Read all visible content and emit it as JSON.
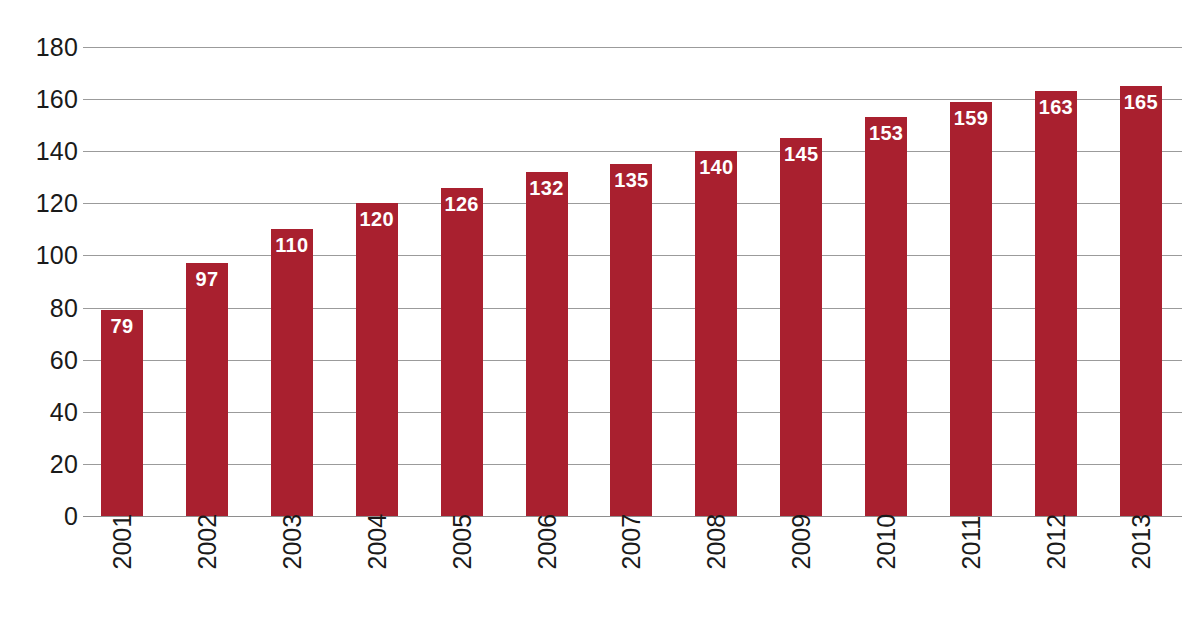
{
  "chart_data": {
    "type": "bar",
    "title": "",
    "subtitle": "",
    "xlabel": "",
    "ylabel": "",
    "categories": [
      "2001",
      "2002",
      "2003",
      "2004",
      "2005",
      "2006",
      "2007",
      "2008",
      "2009",
      "2010",
      "2011",
      "2012",
      "2013"
    ],
    "values": [
      79,
      97,
      110,
      120,
      126,
      132,
      135,
      140,
      145,
      153,
      159,
      163,
      165
    ],
    "data_labels": [
      "79",
      "97",
      "110",
      "120",
      "126",
      "132",
      "135",
      "140",
      "145",
      "153",
      "159",
      "163",
      "165"
    ],
    "ylim": [
      0,
      180
    ],
    "ytick_step": 20,
    "ytick_labels": [
      "180",
      "160",
      "140",
      "120",
      "100",
      "80",
      "60",
      "40",
      "20",
      "0"
    ],
    "ytick_values": [
      180,
      160,
      140,
      120,
      100,
      80,
      60,
      40,
      20,
      0
    ],
    "grid": true,
    "grid_axis": "y",
    "legend": false,
    "legend_position": "none",
    "bar_color": "#a9202f",
    "data_label_color": "#ffffff",
    "gridline_color": "#9b9b9b",
    "axis_text_color": "#1a1a1a",
    "background_color": "#ffffff",
    "xtick_rotation": -90
  }
}
